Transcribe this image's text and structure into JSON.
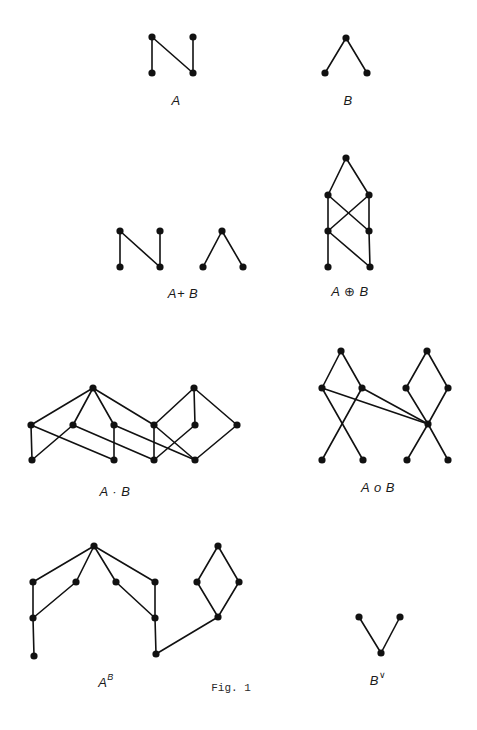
{
  "figure": {
    "caption": "Fig. 1",
    "caption_pos": [
      231,
      688
    ],
    "colors": {
      "ink": "#111111",
      "background": "#ffffff"
    },
    "node_radius": 3.6
  },
  "diagrams": [
    {
      "id": "A",
      "label": "A",
      "label_sup": "",
      "label_pos": [
        176,
        100
      ],
      "nodes": [
        [
          152,
          37
        ],
        [
          193,
          37
        ],
        [
          152,
          73
        ],
        [
          193,
          73
        ]
      ],
      "edges": [
        [
          0,
          2
        ],
        [
          0,
          3
        ],
        [
          1,
          3
        ]
      ]
    },
    {
      "id": "B",
      "label": "B",
      "label_sup": "",
      "label_pos": [
        348,
        100
      ],
      "nodes": [
        [
          346,
          38
        ],
        [
          325,
          73
        ],
        [
          367,
          73
        ]
      ],
      "edges": [
        [
          0,
          1
        ],
        [
          0,
          2
        ]
      ]
    },
    {
      "id": "A_plus_B",
      "label": "A+ B",
      "label_sup": "",
      "label_pos": [
        183,
        293
      ],
      "nodes": [
        [
          120,
          231
        ],
        [
          160,
          231
        ],
        [
          120,
          267
        ],
        [
          160,
          267
        ],
        [
          222,
          231
        ],
        [
          203,
          267
        ],
        [
          243,
          267
        ]
      ],
      "edges": [
        [
          0,
          2
        ],
        [
          0,
          3
        ],
        [
          1,
          3
        ],
        [
          4,
          5
        ],
        [
          4,
          6
        ]
      ]
    },
    {
      "id": "A_oplus_B",
      "label": "A ⊕ B",
      "label_sup": "",
      "label_pos": [
        350,
        291
      ],
      "nodes": [
        [
          346,
          158
        ],
        [
          328,
          195
        ],
        [
          369,
          195
        ],
        [
          328,
          231
        ],
        [
          369,
          231
        ],
        [
          328,
          267
        ],
        [
          370,
          267
        ]
      ],
      "edges": [
        [
          0,
          1
        ],
        [
          0,
          2
        ],
        [
          1,
          3
        ],
        [
          1,
          4
        ],
        [
          2,
          3
        ],
        [
          2,
          4
        ],
        [
          3,
          5
        ],
        [
          3,
          6
        ],
        [
          4,
          6
        ]
      ]
    },
    {
      "id": "A_dot_B",
      "label": "A · B",
      "label_sup": "",
      "label_pos": [
        115,
        491
      ],
      "nodes": [
        [
          93,
          388
        ],
        [
          194,
          388
        ],
        [
          31,
          425
        ],
        [
          73,
          425
        ],
        [
          114,
          425
        ],
        [
          154,
          425
        ],
        [
          195,
          425
        ],
        [
          237,
          425
        ],
        [
          32,
          460
        ],
        [
          114,
          460
        ],
        [
          154,
          460
        ],
        [
          195,
          460
        ]
      ],
      "edges": [
        [
          0,
          2
        ],
        [
          0,
          3
        ],
        [
          0,
          4
        ],
        [
          0,
          5
        ],
        [
          2,
          8
        ],
        [
          2,
          9
        ],
        [
          3,
          8
        ],
        [
          3,
          10
        ],
        [
          4,
          9
        ],
        [
          4,
          11
        ],
        [
          5,
          10
        ],
        [
          5,
          11
        ],
        [
          6,
          10
        ],
        [
          1,
          5
        ],
        [
          1,
          6
        ],
        [
          1,
          7
        ],
        [
          7,
          11
        ]
      ]
    },
    {
      "id": "A_circ_B",
      "label": "A o B",
      "label_sup": "",
      "label_pos": [
        378,
        487
      ],
      "nodes": [
        [
          341,
          351
        ],
        [
          427,
          351
        ],
        [
          322,
          388
        ],
        [
          362,
          388
        ],
        [
          406,
          388
        ],
        [
          448,
          388
        ],
        [
          428,
          424
        ],
        [
          322,
          460
        ],
        [
          363,
          460
        ],
        [
          407,
          460
        ],
        [
          448,
          460
        ]
      ],
      "edges": [
        [
          0,
          2
        ],
        [
          0,
          3
        ],
        [
          1,
          4
        ],
        [
          1,
          5
        ],
        [
          2,
          8
        ],
        [
          3,
          7
        ],
        [
          2,
          6
        ],
        [
          3,
          6
        ],
        [
          4,
          6
        ],
        [
          5,
          6
        ],
        [
          6,
          9
        ],
        [
          6,
          10
        ]
      ]
    },
    {
      "id": "A_pow_B",
      "label": "A",
      "label_sup": "B",
      "label_pos": [
        106,
        682
      ],
      "nodes": [
        [
          94,
          546
        ],
        [
          33,
          582
        ],
        [
          76,
          582
        ],
        [
          116,
          582
        ],
        [
          155,
          582
        ],
        [
          33,
          618
        ],
        [
          155,
          618
        ],
        [
          34,
          656
        ],
        [
          156,
          654
        ],
        [
          218,
          546
        ],
        [
          197,
          582
        ],
        [
          239,
          582
        ],
        [
          218,
          617
        ]
      ],
      "edges": [
        [
          0,
          1
        ],
        [
          0,
          2
        ],
        [
          0,
          3
        ],
        [
          0,
          4
        ],
        [
          1,
          5
        ],
        [
          2,
          5
        ],
        [
          3,
          6
        ],
        [
          4,
          6
        ],
        [
          5,
          7
        ],
        [
          6,
          8
        ],
        [
          8,
          12
        ],
        [
          9,
          10
        ],
        [
          9,
          11
        ],
        [
          10,
          12
        ],
        [
          11,
          12
        ]
      ]
    },
    {
      "id": "B_dual",
      "label": "B",
      "label_sup": "∨",
      "label_pos": [
        378,
        680
      ],
      "nodes": [
        [
          359,
          617
        ],
        [
          400,
          617
        ],
        [
          381,
          653
        ]
      ],
      "edges": [
        [
          0,
          2
        ],
        [
          1,
          2
        ]
      ]
    }
  ]
}
